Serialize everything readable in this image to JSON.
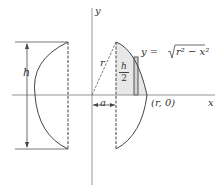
{
  "diagram": {
    "type": "solid-of-revolution-cross-section",
    "labels": {
      "y_axis": "y",
      "x_axis": "x",
      "height": "h",
      "radius": "r",
      "offset": "a",
      "half_height_num": "h",
      "half_height_den": "2",
      "point_label": "(r, 0)",
      "equation_lhs": "y = ",
      "equation_radicand": "r² − x²"
    },
    "colors": {
      "line": "#444444",
      "axis": "#888888",
      "shade": "#e6e6e6"
    }
  }
}
